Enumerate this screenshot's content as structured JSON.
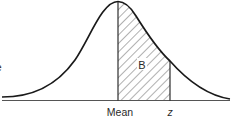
{
  "diagram": {
    "type": "normal-distribution-curve",
    "region_label": "B",
    "x_labels": {
      "mean": "Mean",
      "z": "z"
    },
    "edge_fragment": "e",
    "colors": {
      "stroke": "#1a1a1a",
      "hatch": "#3a3a3a",
      "background": "#ffffff"
    },
    "shaded_region": {
      "from": "Mean",
      "to": "z",
      "pattern": "diagonal-hatch"
    }
  }
}
